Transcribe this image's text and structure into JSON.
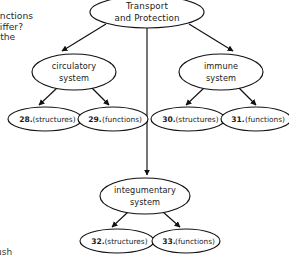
{
  "diagram": {
    "type": "hierarchy-tree",
    "root": {
      "id": "root",
      "label_line1": "Transport",
      "label_line2": "and Protection",
      "cx": 147,
      "cy": 12,
      "rx": 57,
      "ry": 16
    },
    "branches": [
      {
        "id": "circulatory",
        "label_line1": "circulatory",
        "label_line2": "system",
        "cx": 74,
        "cy": 72,
        "rx": 42,
        "ry": 18,
        "children": [
          "leaf-28",
          "leaf-29"
        ]
      },
      {
        "id": "immune",
        "label_line1": "immune",
        "label_line2": "system",
        "cx": 221,
        "cy": 72,
        "rx": 42,
        "ry": 18,
        "children": [
          "leaf-30",
          "leaf-31"
        ]
      },
      {
        "id": "integumentary",
        "label_line1": "integumentary",
        "label_line2": "system",
        "cx": 145,
        "cy": 196,
        "rx": 45,
        "ry": 18,
        "children": [
          "leaf-32",
          "leaf-33"
        ]
      }
    ],
    "leaves": [
      {
        "id": "leaf-28",
        "number": "28.",
        "label": "(structures)",
        "cx": 45,
        "cy": 119,
        "rx": 37,
        "ry": 12
      },
      {
        "id": "leaf-29",
        "number": "29.",
        "label": "(functions)",
        "cx": 113,
        "cy": 119,
        "rx": 35,
        "ry": 12
      },
      {
        "id": "leaf-30",
        "number": "30.",
        "label": "(structures)",
        "cx": 188,
        "cy": 119,
        "rx": 37,
        "ry": 12
      },
      {
        "id": "leaf-31",
        "number": "31.",
        "label": "(functions)",
        "cx": 256,
        "cy": 119,
        "rx": 35,
        "ry": 12
      },
      {
        "id": "leaf-32",
        "number": "32.",
        "label": "(structures)",
        "cx": 117,
        "cy": 241,
        "rx": 37,
        "ry": 12
      },
      {
        "id": "leaf-33",
        "number": "33.",
        "label": "(functions)",
        "cx": 186,
        "cy": 241,
        "rx": 34,
        "ry": 12
      }
    ],
    "colors": {
      "stroke": "#111111",
      "fill": "#ffffff",
      "text": "#1a1a1a"
    }
  },
  "margin": {
    "question_line1": "unctions",
    "question_line2": "differ?",
    "question_line3": "f the",
    "footer": "ush"
  }
}
